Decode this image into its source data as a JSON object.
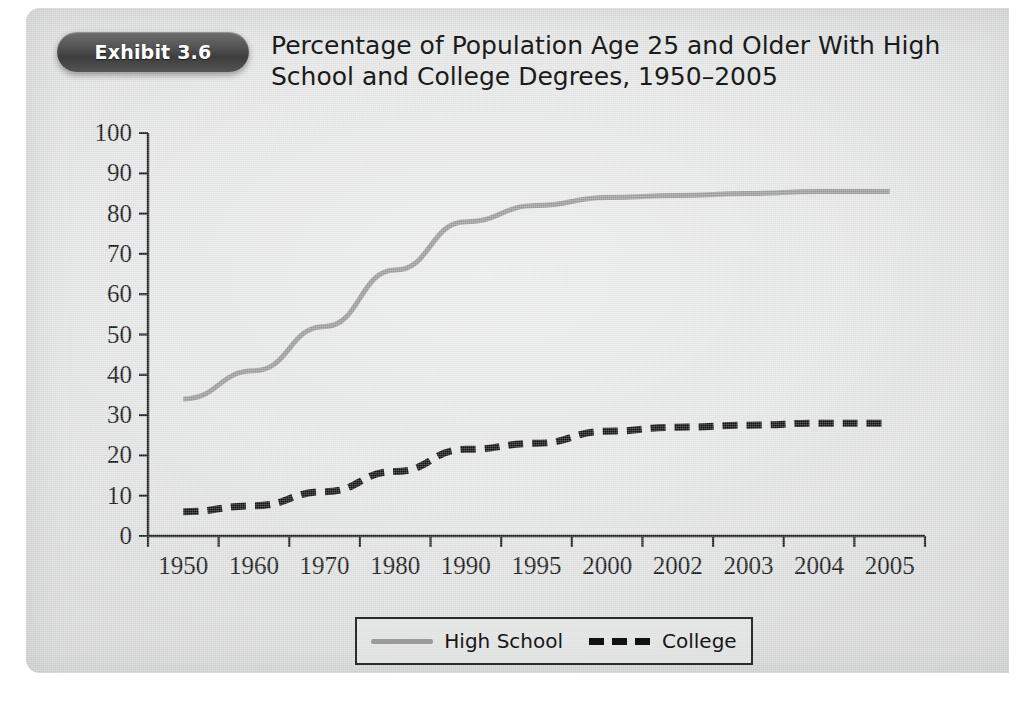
{
  "exhibit": {
    "badge_label": "Exhibit 3.6",
    "title_line1": "Percentage of Population Age 25 and Older With High",
    "title_line2": "School and College Degrees, 1950–2005"
  },
  "colors": {
    "panel_background": "#e4e5e5",
    "badge_background": "#4a4a4a",
    "badge_text": "#ffffff",
    "high_school_line": "#9a9a9a",
    "college_line": "#111111",
    "axis": "#1f1f1f",
    "title_text": "#1b1b1b"
  },
  "legend": {
    "position": "bottom-center",
    "entries": [
      {
        "label": "High School",
        "style": "solid",
        "color": "#9a9a9a"
      },
      {
        "label": "College",
        "style": "dashed",
        "color": "#111111"
      }
    ]
  },
  "chart_data": {
    "type": "line",
    "title": "Percentage of Population Age 25 and Older With High School and College Degrees, 1950–2005",
    "xlabel": "",
    "ylabel": "",
    "categories": [
      "1950",
      "1960",
      "1970",
      "1980",
      "1990",
      "1995",
      "2000",
      "2002",
      "2003",
      "2004",
      "2005"
    ],
    "series": [
      {
        "name": "High School",
        "style": "solid",
        "color": "#9a9a9a",
        "values": [
          34,
          41,
          52,
          66,
          78,
          82,
          84,
          84.5,
          85,
          85.5,
          85.5
        ]
      },
      {
        "name": "College",
        "style": "dashed",
        "color": "#111111",
        "values": [
          6,
          7.5,
          11,
          16,
          21.5,
          23,
          26,
          27,
          27.5,
          28,
          28
        ]
      }
    ],
    "ylim": [
      0,
      100
    ],
    "yticks": [
      0,
      10,
      20,
      30,
      40,
      50,
      60,
      70,
      80,
      90,
      100
    ],
    "ytick_labels": [
      "0",
      "10",
      "20",
      "30",
      "40",
      "50",
      "60",
      "70",
      "80",
      "90",
      "100"
    ],
    "grid": false,
    "legend_position": "bottom-center"
  }
}
